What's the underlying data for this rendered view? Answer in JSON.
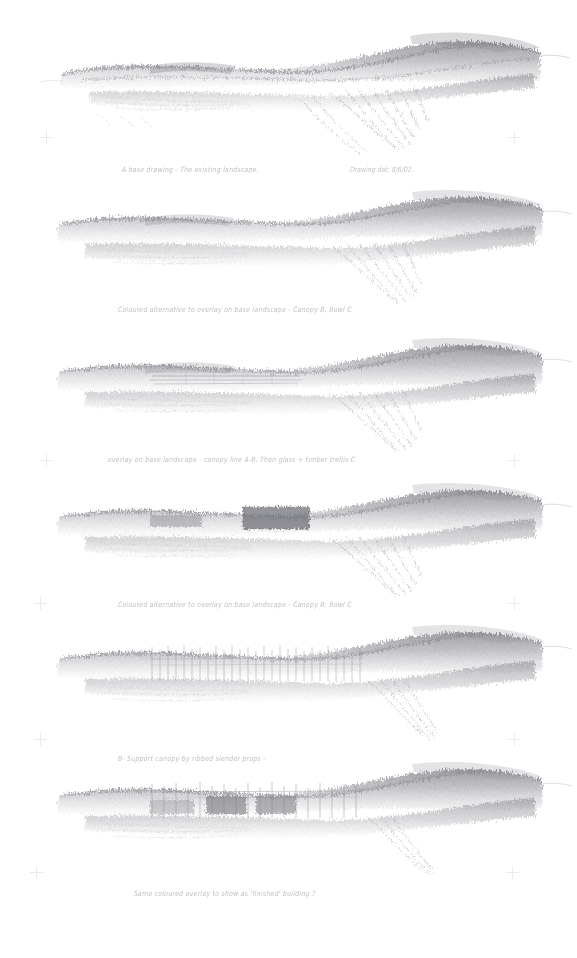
{
  "sheet": {
    "title": "Pencil landscape study sheet",
    "medium": "graphite pencil on white paper",
    "background_color": "#ffffff",
    "graphite_color": "#9a9aa0",
    "panel_count": 6
  },
  "panels": [
    {
      "index": 1,
      "name": "base-drawing",
      "caption": "A base drawing - The existing landscape.",
      "caption_right": "Drawing dat: 8/6/02.",
      "description": "Broad graphite ridge-line landscape, dense tonal mass with a dark hill rising at right and scribbled fall of ground below centre-right."
    },
    {
      "index": 2,
      "name": "coloured-alternative-canopy-b-bowl-c",
      "caption": "Coloured alternative to overlay on base landscape  -  Canopy B, Bowl C",
      "caption_right": "",
      "description": "Same landscape mass, softer, with pale tonal wash suggesting coloured overlay."
    },
    {
      "index": 3,
      "name": "overlay-canopy-line-ab",
      "caption": "overlay on base landscape  - canopy line A-B.  Then glass + timber trellis C",
      "caption_right": "",
      "description": "Landscape with faint straight horizontal canopy lines ruled across the centre of the mass."
    },
    {
      "index": 4,
      "name": "coloured-alternative-canopy-b-bowl-c-2",
      "caption": "Coloured alternative to overlay on base landscape  -  Canopy B, Bowl C",
      "caption_right": "",
      "description": "Landscape with a solid dark rectangular block (canopy / bowl mass) sitting on the ridge."
    },
    {
      "index": 5,
      "name": "support-canopy-props",
      "caption": "B- Support canopy by ribbed slender props -",
      "caption_right": "",
      "description": "Landscape with a dense row of fine vertical lines representing slender props supporting the canopy."
    },
    {
      "index": 6,
      "name": "same-coloured-overlay-finished-building",
      "caption": "Same coloured overlay to show as 'finished' building ?",
      "caption_right": "",
      "description": "Landscape with vertical props plus darker infill panels reading as the completed building."
    }
  ],
  "registration_marks": {
    "name": "registration-cross",
    "glyph": "+",
    "count": 12,
    "color": "#d9d9dd"
  }
}
